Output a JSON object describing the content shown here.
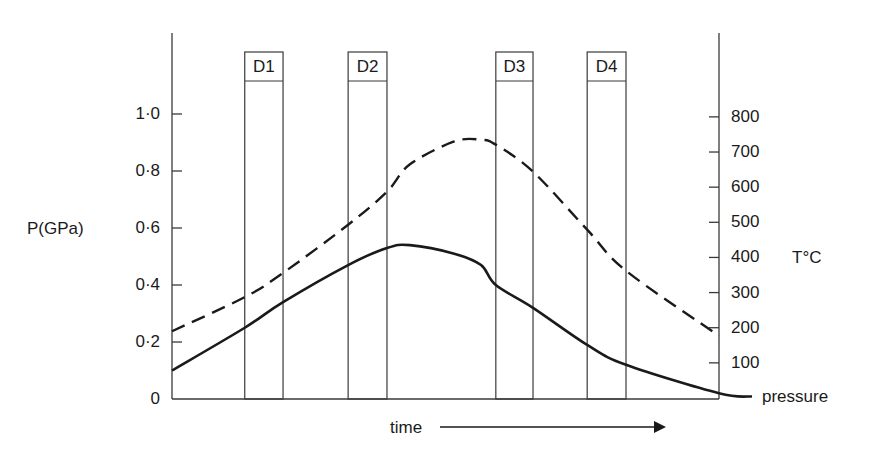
{
  "chart_data": {
    "type": "line",
    "title": "",
    "xlabel": "time",
    "ylabel": "P(GPa)",
    "ylabel_right": "T°C",
    "ylim": [
      0,
      1.0
    ],
    "ylim_right": [
      0,
      800
    ],
    "yticks_left": [
      "0",
      "0·2",
      "0·4",
      "0·6",
      "0·8",
      "1·0"
    ],
    "yticks_left_values": [
      0,
      0.2,
      0.4,
      0.6,
      0.8,
      1.0
    ],
    "yticks_right": [
      "100",
      "200",
      "300",
      "400",
      "500",
      "600",
      "700",
      "800"
    ],
    "yticks_right_values": [
      100,
      200,
      300,
      400,
      500,
      600,
      700,
      800
    ],
    "grid": false,
    "x": [
      0.0,
      0.133,
      0.203,
      0.322,
      0.393,
      0.435,
      0.516,
      0.565,
      0.592,
      0.66,
      0.759,
      0.83,
      1.0
    ],
    "series": [
      {
        "name": "pressure",
        "axis": "left",
        "style": "solid",
        "values": [
          0.1,
          0.25,
          0.34,
          0.47,
          0.53,
          0.54,
          0.51,
          0.47,
          0.4,
          0.32,
          0.19,
          0.12,
          0.02
        ]
      },
      {
        "name": "temperature",
        "axis": "right",
        "style": "dashed",
        "values": [
          190,
          287,
          356,
          493,
          587,
          665,
          730,
          735,
          721,
          644,
          479,
          362,
          177
        ]
      }
    ],
    "annotations": [
      {
        "label": "D1",
        "x_start": 0.133,
        "x_end": 0.203
      },
      {
        "label": "D2",
        "x_start": 0.322,
        "x_end": 0.393
      },
      {
        "label": "D3",
        "x_start": 0.592,
        "x_end": 0.66
      },
      {
        "label": "D4",
        "x_start": 0.759,
        "x_end": 0.83
      }
    ],
    "curve_label": "pressure",
    "time_arrow": true
  },
  "labels": {
    "y_left": "P(GPa)",
    "y_right": "T°C",
    "x": "time",
    "pressure_curve": "pressure"
  },
  "colors": {
    "ink": "#1a1a1a",
    "thin_line": "#3a3a3a",
    "background": "#ffffff"
  }
}
